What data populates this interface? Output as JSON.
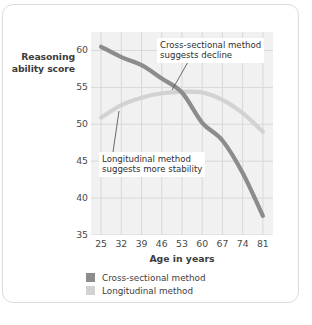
{
  "chart_data": {
    "type": "line",
    "title": "",
    "xlabel": "Age in years",
    "ylabel": "Reasoning ability score",
    "xlim": [
      21.5,
      84.5
    ],
    "ylim": [
      35,
      62.5
    ],
    "grid": true,
    "legend_position": "bottom-left",
    "x": [
      25,
      32,
      39,
      46,
      53,
      60,
      67,
      74,
      81
    ],
    "xticklabels": [
      "25",
      "32",
      "39",
      "46",
      "53",
      "60",
      "67",
      "74",
      "81"
    ],
    "yticks": [
      35,
      40,
      45,
      50,
      55,
      60
    ],
    "yticklabels": [
      "35",
      "40",
      "45",
      "50",
      "55",
      "60"
    ],
    "series": [
      {
        "name": "Cross-sectional method",
        "color": "#8c8c8c",
        "values": [
          60.5,
          59.1,
          58.0,
          56.2,
          54.3,
          50.2,
          47.8,
          43.4,
          37.6
        ]
      },
      {
        "name": "Longitudinal method",
        "color": "#d2d2d2",
        "values": [
          50.9,
          52.6,
          53.6,
          54.2,
          54.4,
          54.3,
          53.3,
          51.5,
          49.0
        ]
      }
    ],
    "annotations": [
      {
        "id": "cross-sectional-callout",
        "line1": "Cross-sectional method",
        "line2": "suggests decline",
        "points_to_series": "Cross-sectional method"
      },
      {
        "id": "longitudinal-callout",
        "line1": "Longitudinal method",
        "line2": "suggests more stability",
        "points_to_series": "Longitudinal method"
      }
    ]
  },
  "axes": {
    "y_title_line1": "Reasoning",
    "y_title_line2": "ability score",
    "x_title": "Age in years"
  },
  "legend": {
    "items": [
      {
        "label": "Cross-sectional method",
        "color": "#8c8c8c"
      },
      {
        "label": "Longitudinal method",
        "color": "#d2d2d2"
      }
    ]
  },
  "colors": {
    "plot_background": "#f1f1f1",
    "grid": "#d8d8d8",
    "card_border": "#dcdcdc",
    "text": "#3d3d3d"
  }
}
